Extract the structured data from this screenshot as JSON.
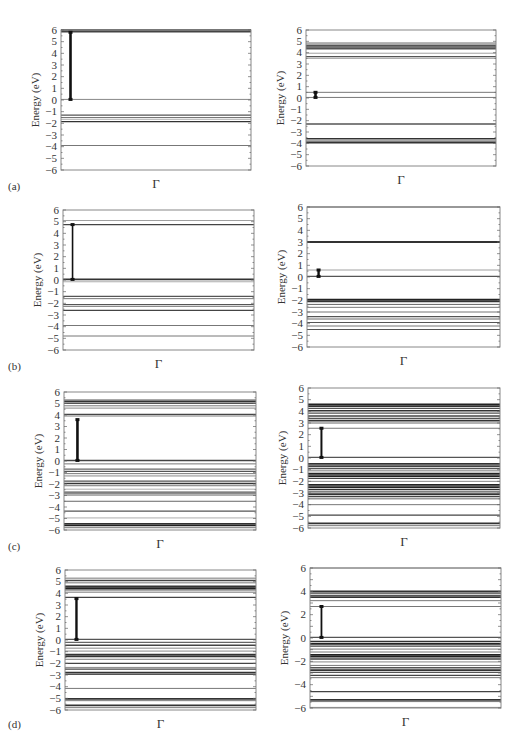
{
  "figure": {
    "panel_labels": [
      "(a)",
      "(b)",
      "(c)",
      "(d)"
    ],
    "x_tick_label": "Γ",
    "y_axis_label": "Energy (eV)"
  },
  "chart_data": [
    {
      "id": "a-left",
      "panel": "(a)",
      "column": "left",
      "type": "line",
      "title": "",
      "xlabel": "Γ",
      "ylabel": "Energy (eV)",
      "ylim": [
        -6,
        6
      ],
      "yticks": [
        6,
        5,
        4,
        3,
        2,
        1,
        0,
        -1,
        -2,
        -3,
        -4,
        -5,
        -6
      ],
      "grid": false,
      "frame": {
        "x": 61,
        "y": 30,
        "w": 190,
        "h": 140
      },
      "bands": [
        {
          "e": 6.0,
          "w": 1.6,
          "c": "#333"
        },
        {
          "e": 5.85,
          "w": 1.6,
          "c": "#444"
        },
        {
          "e": 0.05,
          "w": 1.0,
          "c": "#888"
        },
        {
          "e": -1.3,
          "w": 1.2,
          "c": "#555"
        },
        {
          "e": -1.5,
          "w": 1.0,
          "c": "#777"
        },
        {
          "e": -1.65,
          "w": 0.8,
          "c": "#999"
        },
        {
          "e": -1.85,
          "w": 1.4,
          "c": "#333"
        },
        {
          "e": -3.9,
          "w": 1.0,
          "c": "#777"
        }
      ],
      "gap_arrow": {
        "x_frac": 0.05,
        "from": 0.05,
        "to": 5.8,
        "w": 2.6
      },
      "gap_eV": 5.75
    },
    {
      "id": "a-right",
      "panel": "(a)",
      "column": "right",
      "type": "line",
      "title": "",
      "xlabel": "Γ",
      "ylabel": "Energy (eV)",
      "ylim": [
        -6,
        6
      ],
      "yticks": [
        6,
        5,
        4,
        3,
        2,
        1,
        0,
        -1,
        -2,
        -3,
        -4,
        -5,
        -6
      ],
      "grid": false,
      "frame": {
        "x": 306,
        "y": 30,
        "w": 190,
        "h": 136
      },
      "bands": [
        {
          "e": 4.85,
          "w": 1.0,
          "c": "#666"
        },
        {
          "e": 4.65,
          "w": 1.4,
          "c": "#555"
        },
        {
          "e": 4.5,
          "w": 1.6,
          "c": "#444"
        },
        {
          "e": 4.35,
          "w": 1.4,
          "c": "#555"
        },
        {
          "e": 3.95,
          "w": 0.8,
          "c": "#888"
        },
        {
          "e": 3.65,
          "w": 1.4,
          "c": "#555"
        },
        {
          "e": 3.5,
          "w": 0.8,
          "c": "#888"
        },
        {
          "e": 0.5,
          "w": 1.0,
          "c": "#777"
        },
        {
          "e": 0.05,
          "w": 1.0,
          "c": "#777"
        },
        {
          "e": -2.3,
          "w": 1.4,
          "c": "#555"
        },
        {
          "e": -3.6,
          "w": 1.6,
          "c": "#333"
        },
        {
          "e": -3.8,
          "w": 1.2,
          "c": "#555"
        },
        {
          "e": -3.95,
          "w": 1.6,
          "c": "#333"
        }
      ],
      "gap_arrow": {
        "x_frac": 0.05,
        "from": 0.05,
        "to": 0.5,
        "w": 2.6
      },
      "gap_eV": 0.45
    },
    {
      "id": "b-left",
      "panel": "(b)",
      "column": "left",
      "type": "line",
      "title": "",
      "xlabel": "Γ",
      "ylabel": "Energy (eV)",
      "ylim": [
        -6,
        6
      ],
      "yticks": [
        6,
        5,
        4,
        3,
        2,
        1,
        0,
        -1,
        -2,
        -3,
        -4,
        -5,
        -6
      ],
      "grid": false,
      "frame": {
        "x": 63,
        "y": 210,
        "w": 191,
        "h": 140
      },
      "bands": [
        {
          "e": 5.1,
          "w": 0.8,
          "c": "#888"
        },
        {
          "e": 4.75,
          "w": 1.4,
          "c": "#444"
        },
        {
          "e": 0.05,
          "w": 1.6,
          "c": "#333"
        },
        {
          "e": -0.15,
          "w": 0.8,
          "c": "#999"
        },
        {
          "e": -1.4,
          "w": 1.4,
          "c": "#555"
        },
        {
          "e": -1.6,
          "w": 1.0,
          "c": "#777"
        },
        {
          "e": -2.1,
          "w": 1.2,
          "c": "#555"
        },
        {
          "e": -2.25,
          "w": 1.0,
          "c": "#666"
        },
        {
          "e": -2.6,
          "w": 1.4,
          "c": "#444"
        },
        {
          "e": -3.9,
          "w": 1.0,
          "c": "#777"
        },
        {
          "e": -4.8,
          "w": 1.0,
          "c": "#777"
        }
      ],
      "gap_arrow": {
        "x_frac": 0.05,
        "from": 0.05,
        "to": 4.75,
        "w": 1.6
      },
      "gap_eV": 4.7
    },
    {
      "id": "b-right",
      "panel": "(b)",
      "column": "right",
      "type": "line",
      "title": "",
      "xlabel": "Γ",
      "ylabel": "Energy (eV)",
      "ylim": [
        -6,
        6
      ],
      "yticks": [
        6,
        5,
        4,
        3,
        2,
        1,
        0,
        -1,
        -2,
        -3,
        -4,
        -5,
        -6
      ],
      "grid": false,
      "frame": {
        "x": 307,
        "y": 207,
        "w": 193,
        "h": 140
      },
      "bands": [
        {
          "e": 6.0,
          "w": 1.2,
          "c": "#555"
        },
        {
          "e": 3.0,
          "w": 1.8,
          "c": "#333"
        },
        {
          "e": 0.6,
          "w": 0.8,
          "c": "#888"
        },
        {
          "e": 0.05,
          "w": 1.4,
          "c": "#555"
        },
        {
          "e": -1.95,
          "w": 2.0,
          "c": "#222"
        },
        {
          "e": -2.1,
          "w": 1.6,
          "c": "#333"
        },
        {
          "e": -2.35,
          "w": 1.0,
          "c": "#666"
        },
        {
          "e": -2.6,
          "w": 1.0,
          "c": "#777"
        },
        {
          "e": -3.0,
          "w": 1.0,
          "c": "#777"
        },
        {
          "e": -3.4,
          "w": 1.2,
          "c": "#555"
        },
        {
          "e": -3.6,
          "w": 1.0,
          "c": "#666"
        },
        {
          "e": -3.9,
          "w": 1.2,
          "c": "#555"
        },
        {
          "e": -4.2,
          "w": 1.0,
          "c": "#777"
        },
        {
          "e": -4.5,
          "w": 1.2,
          "c": "#555"
        }
      ],
      "gap_arrow": {
        "x_frac": 0.06,
        "from": 0.05,
        "to": 0.6,
        "w": 2.4
      },
      "gap_eV": 0.55
    },
    {
      "id": "c-left",
      "panel": "(c)",
      "column": "left",
      "type": "line",
      "title": "",
      "xlabel": "Γ",
      "ylabel": "Energy (eV)",
      "ylim": [
        -6,
        6
      ],
      "yticks": [
        6,
        5,
        4,
        3,
        2,
        1,
        0,
        -1,
        -2,
        -3,
        -4,
        -5,
        -6
      ],
      "grid": false,
      "frame": {
        "x": 64,
        "y": 392,
        "w": 192,
        "h": 138
      },
      "bands": [
        {
          "e": 5.3,
          "w": 1.2,
          "c": "#555"
        },
        {
          "e": 5.15,
          "w": 1.6,
          "c": "#333"
        },
        {
          "e": 5.0,
          "w": 1.2,
          "c": "#555"
        },
        {
          "e": 4.8,
          "w": 1.0,
          "c": "#777"
        },
        {
          "e": 4.6,
          "w": 1.0,
          "c": "#888"
        },
        {
          "e": 4.05,
          "w": 1.6,
          "c": "#444"
        },
        {
          "e": 3.9,
          "w": 1.0,
          "c": "#999"
        },
        {
          "e": 0.05,
          "w": 1.4,
          "c": "#444"
        },
        {
          "e": -0.25,
          "w": 1.0,
          "c": "#777"
        },
        {
          "e": -0.7,
          "w": 1.2,
          "c": "#666"
        },
        {
          "e": -0.9,
          "w": 1.2,
          "c": "#555"
        },
        {
          "e": -1.1,
          "w": 1.0,
          "c": "#777"
        },
        {
          "e": -1.3,
          "w": 1.0,
          "c": "#888"
        },
        {
          "e": -1.75,
          "w": 1.2,
          "c": "#555"
        },
        {
          "e": -1.95,
          "w": 1.6,
          "c": "#333"
        },
        {
          "e": -2.15,
          "w": 1.0,
          "c": "#777"
        },
        {
          "e": -2.45,
          "w": 0.8,
          "c": "#999"
        },
        {
          "e": -2.7,
          "w": 1.2,
          "c": "#555"
        },
        {
          "e": -2.85,
          "w": 1.2,
          "c": "#666"
        },
        {
          "e": -3.0,
          "w": 0.8,
          "c": "#999"
        },
        {
          "e": -3.5,
          "w": 1.0,
          "c": "#666"
        },
        {
          "e": -4.35,
          "w": 1.2,
          "c": "#555"
        },
        {
          "e": -4.95,
          "w": 0.8,
          "c": "#999"
        },
        {
          "e": -5.45,
          "w": 1.6,
          "c": "#333"
        },
        {
          "e": -5.6,
          "w": 1.8,
          "c": "#222"
        },
        {
          "e": -5.8,
          "w": 1.0,
          "c": "#777"
        }
      ],
      "gap_arrow": {
        "x_frac": 0.07,
        "from": 0.05,
        "to": 3.6,
        "w": 2.6
      },
      "gap_eV": 3.55
    },
    {
      "id": "c-right",
      "panel": "(c)",
      "column": "right",
      "type": "line",
      "title": "",
      "xlabel": "Γ",
      "ylabel": "Energy (eV)",
      "ylim": [
        -6,
        6
      ],
      "yticks": [
        6,
        5,
        4,
        3,
        2,
        1,
        0,
        -1,
        -2,
        -3,
        -4,
        -5,
        -6
      ],
      "grid": false,
      "frame": {
        "x": 308,
        "y": 388,
        "w": 192,
        "h": 140
      },
      "bands": [
        {
          "e": 4.6,
          "w": 1.8,
          "c": "#222"
        },
        {
          "e": 4.45,
          "w": 1.6,
          "c": "#333"
        },
        {
          "e": 4.25,
          "w": 1.4,
          "c": "#555"
        },
        {
          "e": 4.05,
          "w": 1.6,
          "c": "#333"
        },
        {
          "e": 3.85,
          "w": 1.2,
          "c": "#555"
        },
        {
          "e": 3.6,
          "w": 1.4,
          "c": "#444"
        },
        {
          "e": 3.4,
          "w": 1.4,
          "c": "#555"
        },
        {
          "e": 3.2,
          "w": 1.6,
          "c": "#333"
        },
        {
          "e": 3.0,
          "w": 1.0,
          "c": "#666"
        },
        {
          "e": 2.55,
          "w": 1.0,
          "c": "#777"
        },
        {
          "e": 0.05,
          "w": 1.4,
          "c": "#555"
        },
        {
          "e": -0.5,
          "w": 1.6,
          "c": "#333"
        },
        {
          "e": -0.7,
          "w": 1.6,
          "c": "#444"
        },
        {
          "e": -0.9,
          "w": 1.4,
          "c": "#555"
        },
        {
          "e": -1.1,
          "w": 1.0,
          "c": "#777"
        },
        {
          "e": -1.35,
          "w": 1.8,
          "c": "#222"
        },
        {
          "e": -1.55,
          "w": 1.8,
          "c": "#222"
        },
        {
          "e": -1.75,
          "w": 1.4,
          "c": "#444"
        },
        {
          "e": -2.0,
          "w": 1.0,
          "c": "#888"
        },
        {
          "e": -2.3,
          "w": 1.8,
          "c": "#222"
        },
        {
          "e": -2.5,
          "w": 1.8,
          "c": "#222"
        },
        {
          "e": -2.7,
          "w": 1.6,
          "c": "#333"
        },
        {
          "e": -2.9,
          "w": 1.2,
          "c": "#555"
        },
        {
          "e": -3.1,
          "w": 1.6,
          "c": "#333"
        },
        {
          "e": -3.3,
          "w": 1.4,
          "c": "#444"
        },
        {
          "e": -3.5,
          "w": 1.0,
          "c": "#666"
        },
        {
          "e": -4.0,
          "w": 1.0,
          "c": "#777"
        },
        {
          "e": -4.9,
          "w": 1.4,
          "c": "#444"
        },
        {
          "e": -5.6,
          "w": 1.6,
          "c": "#333"
        },
        {
          "e": -5.8,
          "w": 1.0,
          "c": "#777"
        }
      ],
      "gap_arrow": {
        "x_frac": 0.07,
        "from": 0.05,
        "to": 2.55,
        "w": 2.0
      },
      "gap_eV": 2.5
    },
    {
      "id": "d-left",
      "panel": "(d)",
      "column": "left",
      "type": "line",
      "title": "",
      "xlabel": "Γ",
      "ylabel": "Energy (eV)",
      "ylim": [
        -6,
        6
      ],
      "yticks": [
        6,
        5,
        4,
        3,
        2,
        1,
        0,
        -1,
        -2,
        -3,
        -4,
        -5,
        -6
      ],
      "grid": false,
      "frame": {
        "x": 65,
        "y": 570,
        "w": 191,
        "h": 140
      },
      "bands": [
        {
          "e": 5.3,
          "w": 1.0,
          "c": "#777"
        },
        {
          "e": 5.1,
          "w": 1.4,
          "c": "#444"
        },
        {
          "e": 4.9,
          "w": 1.0,
          "c": "#777"
        },
        {
          "e": 4.6,
          "w": 1.6,
          "c": "#333"
        },
        {
          "e": 4.45,
          "w": 1.8,
          "c": "#222"
        },
        {
          "e": 4.3,
          "w": 1.4,
          "c": "#555"
        },
        {
          "e": 4.1,
          "w": 1.0,
          "c": "#777"
        },
        {
          "e": 3.65,
          "w": 1.4,
          "c": "#444"
        },
        {
          "e": 0.05,
          "w": 1.4,
          "c": "#555"
        },
        {
          "e": -0.2,
          "w": 1.2,
          "c": "#666"
        },
        {
          "e": -0.45,
          "w": 1.4,
          "c": "#444"
        },
        {
          "e": -0.7,
          "w": 1.0,
          "c": "#888"
        },
        {
          "e": -0.95,
          "w": 1.0,
          "c": "#888"
        },
        {
          "e": -1.25,
          "w": 1.6,
          "c": "#333"
        },
        {
          "e": -1.4,
          "w": 1.6,
          "c": "#333"
        },
        {
          "e": -1.65,
          "w": 1.0,
          "c": "#777"
        },
        {
          "e": -2.0,
          "w": 1.4,
          "c": "#444"
        },
        {
          "e": -2.35,
          "w": 1.0,
          "c": "#888"
        },
        {
          "e": -2.5,
          "w": 1.4,
          "c": "#444"
        },
        {
          "e": -2.8,
          "w": 1.6,
          "c": "#333"
        },
        {
          "e": -2.95,
          "w": 1.2,
          "c": "#555"
        },
        {
          "e": -4.15,
          "w": 1.0,
          "c": "#777"
        },
        {
          "e": -5.05,
          "w": 1.6,
          "c": "#333"
        },
        {
          "e": -5.2,
          "w": 1.0,
          "c": "#777"
        },
        {
          "e": -5.6,
          "w": 1.6,
          "c": "#333"
        },
        {
          "e": -5.8,
          "w": 1.0,
          "c": "#777"
        }
      ],
      "gap_arrow": {
        "x_frac": 0.06,
        "from": 0.05,
        "to": 3.55,
        "w": 2.4
      },
      "gap_eV": 3.5
    },
    {
      "id": "d-right",
      "panel": "(d)",
      "column": "right",
      "type": "line",
      "title": "",
      "xlabel": "Γ",
      "ylabel": "Energy (eV)",
      "ylim": [
        -6,
        6
      ],
      "yticks": [
        6,
        4,
        2,
        0,
        -2,
        -4,
        -6
      ],
      "grid": false,
      "frame": {
        "x": 310,
        "y": 568,
        "w": 191,
        "h": 140
      },
      "bands": [
        {
          "e": 6.0,
          "w": 1.0,
          "c": "#888"
        },
        {
          "e": 4.0,
          "w": 1.6,
          "c": "#333"
        },
        {
          "e": 3.85,
          "w": 1.4,
          "c": "#444"
        },
        {
          "e": 3.65,
          "w": 1.4,
          "c": "#555"
        },
        {
          "e": 3.5,
          "w": 1.6,
          "c": "#333"
        },
        {
          "e": 3.2,
          "w": 1.0,
          "c": "#777"
        },
        {
          "e": 2.7,
          "w": 1.0,
          "c": "#777"
        },
        {
          "e": 0.05,
          "w": 1.4,
          "c": "#555"
        },
        {
          "e": -0.3,
          "w": 1.6,
          "c": "#333"
        },
        {
          "e": -0.5,
          "w": 1.8,
          "c": "#222"
        },
        {
          "e": -0.7,
          "w": 1.4,
          "c": "#444"
        },
        {
          "e": -0.95,
          "w": 1.0,
          "c": "#777"
        },
        {
          "e": -1.2,
          "w": 1.0,
          "c": "#777"
        },
        {
          "e": -1.45,
          "w": 1.8,
          "c": "#222"
        },
        {
          "e": -1.6,
          "w": 1.8,
          "c": "#222"
        },
        {
          "e": -1.8,
          "w": 1.4,
          "c": "#444"
        },
        {
          "e": -2.05,
          "w": 1.0,
          "c": "#888"
        },
        {
          "e": -2.35,
          "w": 1.0,
          "c": "#777"
        },
        {
          "e": -2.55,
          "w": 1.4,
          "c": "#555"
        },
        {
          "e": -2.75,
          "w": 1.6,
          "c": "#333"
        },
        {
          "e": -2.95,
          "w": 1.2,
          "c": "#555"
        },
        {
          "e": -3.2,
          "w": 1.4,
          "c": "#444"
        },
        {
          "e": -3.4,
          "w": 1.0,
          "c": "#777"
        },
        {
          "e": -4.6,
          "w": 1.4,
          "c": "#444"
        },
        {
          "e": -5.3,
          "w": 1.6,
          "c": "#333"
        },
        {
          "e": -5.45,
          "w": 1.0,
          "c": "#777"
        },
        {
          "e": -5.95,
          "w": 1.0,
          "c": "#888"
        }
      ],
      "gap_arrow": {
        "x_frac": 0.06,
        "from": 0.05,
        "to": 2.7,
        "w": 1.8
      },
      "gap_eV": 2.65
    }
  ]
}
